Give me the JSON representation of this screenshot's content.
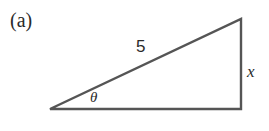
{
  "figure": {
    "panel_label": "(a)",
    "shape": "right-triangle",
    "labels": {
      "hypotenuse": "5",
      "opposite": "x",
      "angle": "θ"
    },
    "stroke_color": "#555555",
    "text_color": "#2a2a2a"
  }
}
